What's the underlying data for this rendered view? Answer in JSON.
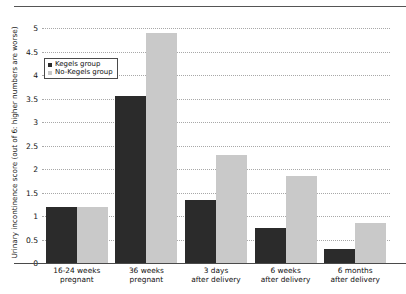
{
  "chart_data": {
    "type": "bar",
    "title": "",
    "xlabel": "",
    "ylabel": "Urinary incontinence score (out of 6: higher numbers are worse)",
    "ylim": [
      0,
      5
    ],
    "grid": true,
    "legend_position": "top-left-inside",
    "categories": [
      "16-24 weeks\npregnant",
      "36 weeks\npregnant",
      "3 days\nafter delivery",
      "6 weeks\nafter delivery",
      "6 months\nafter delivery"
    ],
    "category_lines": [
      [
        "16-24 weeks",
        "pregnant"
      ],
      [
        "36 weeks",
        "pregnant"
      ],
      [
        "3 days",
        "after delivery"
      ],
      [
        "6 weeks",
        "after delivery"
      ],
      [
        "6 months",
        "after delivery"
      ]
    ],
    "yticks": [
      "0",
      "0.5",
      "1",
      "1.5",
      "2",
      "2.5",
      "3",
      "3.5",
      "4",
      "4.5",
      "5"
    ],
    "ytick_values": [
      0,
      0.5,
      1,
      1.5,
      2,
      2.5,
      3,
      3.5,
      4,
      4.5,
      5
    ],
    "series": [
      {
        "name": "Kegels group",
        "color": "#2b2b2b",
        "values": [
          1.2,
          3.55,
          1.35,
          0.75,
          0.3
        ]
      },
      {
        "name": "No-Kegels group",
        "color": "#c9c9c9",
        "values": [
          1.2,
          4.9,
          2.3,
          1.85,
          0.85
        ]
      }
    ]
  },
  "legend": {
    "items": [
      {
        "label": "Kegels group",
        "color": "#2b2b2b"
      },
      {
        "label": "No-Kegels group",
        "color": "#c9c9c9"
      }
    ]
  },
  "axis": {
    "y_title": "Urinary incontinence score (out of 6: higher numbers are worse)"
  },
  "colors": {
    "kegels": "#2b2b2b",
    "no_kegels": "#c9c9c9",
    "gridline": "#a8a8a8",
    "axis": "#4a4a4a",
    "text": "#111111",
    "background": "#ffffff"
  }
}
